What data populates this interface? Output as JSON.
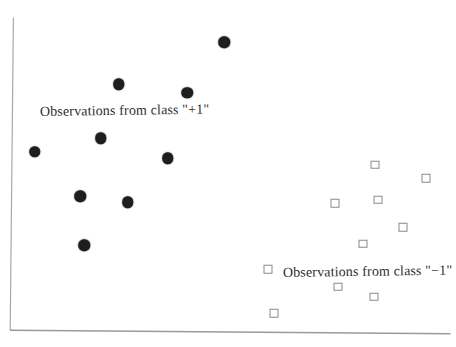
{
  "figure": {
    "background_color": "#ffffff",
    "axis_color": "#a0a0a0",
    "text_color": "#2e2e2e"
  },
  "chart_data": {
    "type": "scatter",
    "title": "",
    "xlabel": "",
    "ylabel": "",
    "x_range": [
      0,
      1
    ],
    "y_range": [
      0,
      1
    ],
    "grid": false,
    "ticks": false,
    "legend": "none (in-plot text annotations)",
    "series": [
      {
        "name": "Observations from class \"+1\"",
        "marker": "filled-circle",
        "color": "#1e1e1e",
        "points": [
          [
            0.486,
            0.923
          ],
          [
            0.247,
            0.788
          ],
          [
            0.402,
            0.76
          ],
          [
            0.206,
            0.615
          ],
          [
            0.056,
            0.571
          ],
          [
            0.358,
            0.55
          ],
          [
            0.159,
            0.428
          ],
          [
            0.267,
            0.41
          ],
          [
            0.168,
            0.272
          ]
        ]
      },
      {
        "name": "Observations from class \"−1\"",
        "marker": "open-square",
        "color": "#8a8a8a",
        "points": [
          [
            0.828,
            0.53
          ],
          [
            0.945,
            0.486
          ],
          [
            0.836,
            0.417
          ],
          [
            0.738,
            0.407
          ],
          [
            0.892,
            0.33
          ],
          [
            0.801,
            0.277
          ],
          [
            0.585,
            0.194
          ],
          [
            0.745,
            0.139
          ],
          [
            0.827,
            0.106
          ],
          [
            0.6,
            0.054
          ]
        ]
      }
    ],
    "annotations": [
      {
        "text": "Observations from class \"+1\"",
        "x": 40,
        "y": 103.5
      },
      {
        "text": "Observations from class \"−1\"",
        "x": 283,
        "y": 265
      }
    ]
  }
}
